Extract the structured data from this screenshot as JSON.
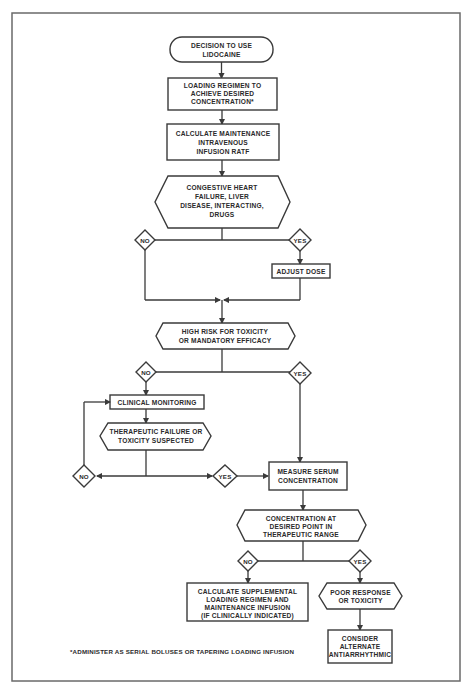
{
  "flowchart": {
    "start": {
      "lines": [
        "DECISION TO USE",
        "LIDOCAINE"
      ]
    },
    "loading": {
      "lines": [
        "LOADING REGIMEN TO",
        "ACHIEVE DESIRED",
        "CONCENTRATION*"
      ]
    },
    "maintenance": {
      "lines": [
        "CALCULATE MAINTENANCE",
        "INTRAVENOUS",
        "INFUSION RATF"
      ]
    },
    "chf_decision": {
      "lines": [
        "CONGESTIVE HEART",
        "FAILURE, LIVER",
        "DISEASE, INTERACTING,",
        "DRUGS"
      ]
    },
    "chf_no": "NO",
    "chf_yes": "YES",
    "adjust_dose": "ADJUST DOSE",
    "high_risk": {
      "lines": [
        "HIGH RISK FOR TOXICITY",
        "OR MANDATORY EFFICACY"
      ]
    },
    "risk_no": "NO",
    "risk_yes": "YES",
    "clinical_monitoring": "CLINICAL MONITORING",
    "failure_suspected": {
      "lines": [
        "THERAPEUTIC FAILURE OR",
        "TOXICITY SUSPECTED"
      ]
    },
    "suspect_no": "NO",
    "suspect_yes": "YES",
    "measure_serum": {
      "lines": [
        "MEASURE SERUM",
        "CONCENTRATION"
      ]
    },
    "conc_decision": {
      "lines": [
        "CONCENTRATION AT",
        "DESIRED POINT IN",
        "THERAPEUTIC RANGE"
      ]
    },
    "conc_no": "NO",
    "conc_yes": "YES",
    "supplemental": {
      "lines": [
        "CALCULATE SUPPLEMENTAL",
        "LOADING REGIMEN AND",
        "MAINTENANCE INFUSION",
        "(IF CLINICALLY INDICATED)"
      ]
    },
    "poor_response": {
      "lines": [
        "POOR RESPONSE",
        "OR TOXICITY"
      ]
    },
    "alternate": {
      "lines": [
        "CONSIDER",
        "ALTERNATE",
        "ANTIARRHYTHMIC"
      ]
    },
    "footnote": "*ADMINISTER AS SERIAL BOLUSES OR TAPERING LOADING INFUSION"
  },
  "colors": {
    "line": "#3a3a3a",
    "frame": "#6a6a6a",
    "background": "#ffffff"
  }
}
